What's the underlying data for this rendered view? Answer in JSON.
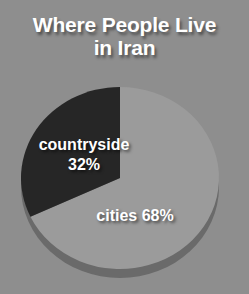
{
  "colors": {
    "background": "#8e8e8e",
    "title_text": "#ffffff",
    "slice_cities": "#9b9b9b",
    "slice_countryside": "#262626",
    "pie_rim_shadow": "#6a6a6a",
    "label_text": "#ffffff"
  },
  "header": {
    "title": "Where People Live\nin Iran",
    "title_line1": "Where People Live",
    "title_line2": "in Iran"
  },
  "labels": {
    "countryside": "countryside\n32%",
    "cities": "cities 68%"
  },
  "chart_data": {
    "type": "pie",
    "title": "Where People Live in Iran",
    "subtitle": "",
    "xlabel": "",
    "ylabel": "",
    "units": "percent",
    "legend": "none",
    "grid": false,
    "start_angle_deg": 0,
    "direction": "counterclockwise",
    "categories": [
      "cities",
      "countryside"
    ],
    "values": [
      68,
      32
    ],
    "slices": [
      {
        "label": "cities",
        "value": 68,
        "display": "cities 68%",
        "color": "#9b9b9b",
        "start_angle_deg": 0,
        "end_angle_deg": 244.8
      },
      {
        "label": "countryside",
        "value": 32,
        "display": "countryside 32%",
        "color": "#262626",
        "start_angle_deg": 244.8,
        "end_angle_deg": 360
      }
    ],
    "annotations": [
      "countryside 32%",
      "cities 68%"
    ]
  }
}
